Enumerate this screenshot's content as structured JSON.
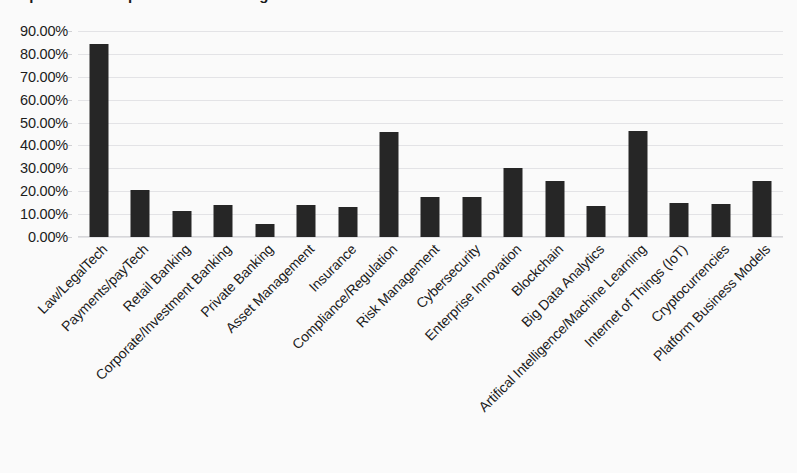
{
  "chart_data": {
    "type": "bar",
    "title": "Importance of topics for the banking and financial sector",
    "xlabel": "",
    "ylabel": "",
    "ylim": [
      0,
      90
    ],
    "grid": true,
    "legend": false,
    "y_tick_labels": [
      "90.00%",
      "80.00%",
      "70.00%",
      "60.00%",
      "50.00%",
      "40.00%",
      "30.00%",
      "20.00%",
      "10.00%",
      "0.00%"
    ],
    "y_tick_values": [
      90,
      80,
      70,
      60,
      50,
      40,
      30,
      20,
      10,
      0
    ],
    "bar_color": "#262626",
    "gridline_color": "#e3e3e6",
    "background_color": "#fafafa",
    "categories": [
      "Law/LegalTech",
      "Payments/payTech",
      "Retail Banking",
      "Corporate/Investment Banking",
      "Private Banking",
      "Asset Management",
      "Insurance",
      "Compliance/Regulation",
      "Risk Management",
      "Cybersecurity",
      "Enterprise Innovation",
      "Blockchain",
      "Big Data Analytics",
      "Artifical Intelligence/Machine Learning",
      "Internet of Things (IoT)",
      "Cryptocurrencies",
      "Platform Business Models"
    ],
    "values": [
      84.3,
      20.5,
      11.5,
      14.0,
      5.7,
      14.0,
      13.0,
      46.0,
      17.5,
      17.5,
      30.0,
      24.5,
      13.5,
      46.5,
      15.0,
      14.5,
      24.5
    ]
  }
}
